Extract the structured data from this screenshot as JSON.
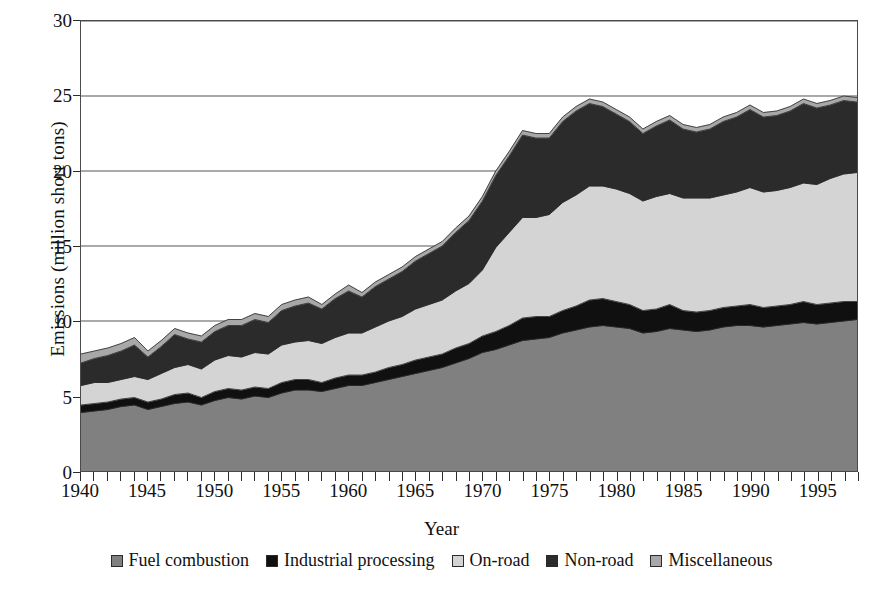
{
  "figure": {
    "xlabel": "Year",
    "ylabel": "Emissions (million short tons)"
  },
  "axes": {
    "y_ticks": [
      "0",
      "5",
      "10",
      "15",
      "20",
      "25",
      "30"
    ],
    "x_ticks": [
      "1940",
      "1945",
      "1950",
      "1955",
      "1960",
      "1965",
      "1970",
      "1975",
      "1980",
      "1985",
      "1990",
      "1995"
    ]
  },
  "legend": {
    "items": [
      {
        "label": "Fuel combustion",
        "color": "#808080"
      },
      {
        "label": "Industrial processing",
        "color": "#101010"
      },
      {
        "label": "On-road",
        "color": "#d4d4d4"
      },
      {
        "label": "Non-road",
        "color": "#2b2b2b"
      },
      {
        "label": "Miscellaneous",
        "color": "#a8a8a8"
      }
    ]
  },
  "chart_data": {
    "type": "area",
    "stacked": true,
    "title": "",
    "xlabel": "Year",
    "ylabel": "Emissions (million short tons)",
    "xlim": [
      1940,
      1998
    ],
    "ylim": [
      0,
      30
    ],
    "ytick_interval": 5,
    "xtick_label_interval": 5,
    "xtick_minor_interval": 1,
    "grid": "horizontal",
    "legend_position": "bottom",
    "x": [
      1940,
      1941,
      1942,
      1943,
      1944,
      1945,
      1946,
      1947,
      1948,
      1949,
      1950,
      1951,
      1952,
      1953,
      1954,
      1955,
      1956,
      1957,
      1958,
      1959,
      1960,
      1961,
      1962,
      1963,
      1964,
      1965,
      1966,
      1967,
      1968,
      1969,
      1970,
      1971,
      1972,
      1973,
      1974,
      1975,
      1976,
      1977,
      1978,
      1979,
      1980,
      1981,
      1982,
      1983,
      1984,
      1985,
      1986,
      1987,
      1988,
      1989,
      1990,
      1991,
      1992,
      1993,
      1994,
      1995,
      1996,
      1997,
      1998
    ],
    "series": [
      {
        "name": "Fuel combustion",
        "color": "#808080",
        "values": [
          3.9,
          4.0,
          4.1,
          4.3,
          4.4,
          4.1,
          4.3,
          4.5,
          4.6,
          4.4,
          4.7,
          4.9,
          4.8,
          5.0,
          4.9,
          5.2,
          5.4,
          5.4,
          5.3,
          5.5,
          5.7,
          5.7,
          5.9,
          6.1,
          6.3,
          6.5,
          6.7,
          6.9,
          7.2,
          7.5,
          7.9,
          8.1,
          8.4,
          8.7,
          8.8,
          8.9,
          9.2,
          9.4,
          9.6,
          9.7,
          9.6,
          9.5,
          9.2,
          9.3,
          9.5,
          9.4,
          9.3,
          9.4,
          9.6,
          9.7,
          9.7,
          9.6,
          9.7,
          9.8,
          9.9,
          9.8,
          9.9,
          10.0,
          10.1
        ]
      },
      {
        "name": "Industrial processing",
        "color": "#101010",
        "values": [
          0.5,
          0.5,
          0.5,
          0.5,
          0.5,
          0.5,
          0.5,
          0.6,
          0.6,
          0.5,
          0.6,
          0.6,
          0.6,
          0.6,
          0.6,
          0.7,
          0.7,
          0.7,
          0.6,
          0.7,
          0.7,
          0.7,
          0.7,
          0.8,
          0.8,
          0.9,
          0.9,
          0.9,
          1.0,
          1.0,
          1.1,
          1.2,
          1.3,
          1.5,
          1.5,
          1.4,
          1.5,
          1.6,
          1.8,
          1.8,
          1.7,
          1.6,
          1.5,
          1.5,
          1.6,
          1.3,
          1.3,
          1.3,
          1.3,
          1.3,
          1.4,
          1.3,
          1.3,
          1.3,
          1.4,
          1.3,
          1.3,
          1.3,
          1.2
        ]
      },
      {
        "name": "On-road",
        "color": "#d4d4d4",
        "values": [
          1.3,
          1.4,
          1.3,
          1.3,
          1.4,
          1.5,
          1.7,
          1.8,
          1.9,
          1.9,
          2.1,
          2.2,
          2.2,
          2.3,
          2.3,
          2.5,
          2.5,
          2.6,
          2.6,
          2.7,
          2.8,
          2.8,
          3.0,
          3.1,
          3.2,
          3.4,
          3.5,
          3.6,
          3.8,
          4.0,
          4.4,
          5.6,
          6.2,
          6.7,
          6.6,
          6.8,
          7.2,
          7.4,
          7.6,
          7.5,
          7.5,
          7.4,
          7.3,
          7.5,
          7.4,
          7.5,
          7.6,
          7.5,
          7.5,
          7.6,
          7.8,
          7.7,
          7.7,
          7.8,
          7.9,
          8.0,
          8.3,
          8.5,
          8.6
        ]
      },
      {
        "name": "Non-road",
        "color": "#2b2b2b",
        "values": [
          1.5,
          1.6,
          1.8,
          1.9,
          2.1,
          1.5,
          1.8,
          2.2,
          1.7,
          1.8,
          1.9,
          2.0,
          2.1,
          2.2,
          2.1,
          2.3,
          2.4,
          2.5,
          2.3,
          2.6,
          2.8,
          2.4,
          2.7,
          2.8,
          3.0,
          3.2,
          3.4,
          3.6,
          3.9,
          4.2,
          4.6,
          4.8,
          5.1,
          5.5,
          5.3,
          5.1,
          5.4,
          5.6,
          5.5,
          5.3,
          5.0,
          4.8,
          4.5,
          4.7,
          4.9,
          4.6,
          4.4,
          4.6,
          4.9,
          5.0,
          5.2,
          5.0,
          5.0,
          5.1,
          5.3,
          5.1,
          4.9,
          4.9,
          4.7
        ]
      },
      {
        "name": "Miscellaneous",
        "color": "#a8a8a8",
        "values": [
          0.6,
          0.5,
          0.5,
          0.5,
          0.5,
          0.4,
          0.4,
          0.4,
          0.4,
          0.4,
          0.4,
          0.4,
          0.4,
          0.4,
          0.4,
          0.4,
          0.4,
          0.4,
          0.3,
          0.3,
          0.4,
          0.3,
          0.3,
          0.3,
          0.3,
          0.3,
          0.3,
          0.3,
          0.3,
          0.3,
          0.3,
          0.3,
          0.3,
          0.3,
          0.3,
          0.3,
          0.3,
          0.3,
          0.3,
          0.3,
          0.3,
          0.3,
          0.3,
          0.3,
          0.3,
          0.3,
          0.3,
          0.3,
          0.3,
          0.3,
          0.3,
          0.3,
          0.3,
          0.3,
          0.3,
          0.3,
          0.3,
          0.3,
          0.3
        ]
      }
    ]
  }
}
